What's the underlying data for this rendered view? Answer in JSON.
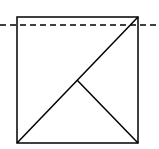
{
  "diagram": {
    "stroke_color": "#000000",
    "background_color": "#ffffff",
    "square": {
      "x1": 17,
      "y1": 17,
      "x2": 138,
      "y2": 143
    },
    "diagonal": {
      "x1": 17,
      "y1": 143,
      "x2": 138,
      "y2": 17
    },
    "inner_segment": {
      "x1": 77,
      "y1": 80,
      "x2": 138,
      "y2": 143
    },
    "dashed_line": {
      "x1": 0,
      "y1": 25,
      "x2": 159,
      "y2": 25,
      "dash": "6,4"
    }
  }
}
